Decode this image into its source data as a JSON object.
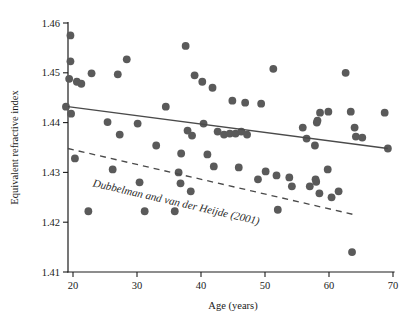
{
  "chart_data": {
    "type": "scatter",
    "title": "",
    "xlabel": "Age (years)",
    "ylabel": "Equivalent refractive index",
    "xlim": [
      18,
      70
    ],
    "ylim": [
      1.41,
      1.46
    ],
    "xticks": [
      20,
      30,
      40,
      50,
      60,
      70
    ],
    "yticks": [
      "1.41",
      "1.42",
      "1.43",
      "1.44",
      "1.45",
      "1.46"
    ],
    "grid": false,
    "legend": "none",
    "points": [
      {
        "x": 19.6,
        "y": 1.4575
      },
      {
        "x": 19.6,
        "y": 1.4523
      },
      {
        "x": 19.4,
        "y": 1.4488
      },
      {
        "x": 20.6,
        "y": 1.4482
      },
      {
        "x": 21.3,
        "y": 1.4478
      },
      {
        "x": 19.7,
        "y": 1.4418
      },
      {
        "x": 20.3,
        "y": 1.4328
      },
      {
        "x": 22.4,
        "y": 1.4222
      },
      {
        "x": 22.9,
        "y": 1.4499
      },
      {
        "x": 25.4,
        "y": 1.4401
      },
      {
        "x": 27.0,
        "y": 1.4497
      },
      {
        "x": 27.3,
        "y": 1.4376
      },
      {
        "x": 26.2,
        "y": 1.4306
      },
      {
        "x": 30.1,
        "y": 1.4398
      },
      {
        "x": 28.4,
        "y": 1.4527
      },
      {
        "x": 30.4,
        "y": 1.428
      },
      {
        "x": 31.2,
        "y": 1.4222
      },
      {
        "x": 34.5,
        "y": 1.4432
      },
      {
        "x": 36.5,
        "y": 1.43
      },
      {
        "x": 36.8,
        "y": 1.4278
      },
      {
        "x": 36.9,
        "y": 1.4338
      },
      {
        "x": 37.6,
        "y": 1.4554
      },
      {
        "x": 37.9,
        "y": 1.4384
      },
      {
        "x": 38.6,
        "y": 1.4374
      },
      {
        "x": 39.0,
        "y": 1.4495
      },
      {
        "x": 38.4,
        "y": 1.4262
      },
      {
        "x": 40.2,
        "y": 1.4482
      },
      {
        "x": 40.4,
        "y": 1.4398
      },
      {
        "x": 41.0,
        "y": 1.4336
      },
      {
        "x": 41.8,
        "y": 1.447
      },
      {
        "x": 42.6,
        "y": 1.4382
      },
      {
        "x": 42.0,
        "y": 1.4312
      },
      {
        "x": 43.6,
        "y": 1.4376
      },
      {
        "x": 44.5,
        "y": 1.4378
      },
      {
        "x": 44.9,
        "y": 1.4444
      },
      {
        "x": 45.4,
        "y": 1.4378
      },
      {
        "x": 45.9,
        "y": 1.431
      },
      {
        "x": 46.3,
        "y": 1.4382
      },
      {
        "x": 46.9,
        "y": 1.444
      },
      {
        "x": 47.2,
        "y": 1.4376
      },
      {
        "x": 48.9,
        "y": 1.4286
      },
      {
        "x": 49.4,
        "y": 1.4438
      },
      {
        "x": 50.1,
        "y": 1.4302
      },
      {
        "x": 51.8,
        "y": 1.4294
      },
      {
        "x": 52.0,
        "y": 1.4225
      },
      {
        "x": 51.3,
        "y": 1.4508
      },
      {
        "x": 53.8,
        "y": 1.429
      },
      {
        "x": 54.2,
        "y": 1.4272
      },
      {
        "x": 55.9,
        "y": 1.439
      },
      {
        "x": 56.5,
        "y": 1.4368
      },
      {
        "x": 57.0,
        "y": 1.4272
      },
      {
        "x": 57.8,
        "y": 1.4354
      },
      {
        "x": 57.9,
        "y": 1.4286
      },
      {
        "x": 58.0,
        "y": 1.4281
      },
      {
        "x": 58.1,
        "y": 1.44
      },
      {
        "x": 58.2,
        "y": 1.4404
      },
      {
        "x": 58.6,
        "y": 1.442
      },
      {
        "x": 58.5,
        "y": 1.4258
      },
      {
        "x": 59.8,
        "y": 1.4306
      },
      {
        "x": 59.9,
        "y": 1.4422
      },
      {
        "x": 60.4,
        "y": 1.425
      },
      {
        "x": 61.5,
        "y": 1.4262
      },
      {
        "x": 62.6,
        "y": 1.45
      },
      {
        "x": 63.4,
        "y": 1.4422
      },
      {
        "x": 63.6,
        "y": 1.414
      },
      {
        "x": 64.0,
        "y": 1.439
      },
      {
        "x": 64.2,
        "y": 1.4372
      },
      {
        "x": 65.2,
        "y": 1.437
      },
      {
        "x": 68.7,
        "y": 1.442
      },
      {
        "x": 69.2,
        "y": 1.4348
      },
      {
        "x": 18.9,
        "y": 1.4432
      },
      {
        "x": 33.0,
        "y": 1.4354
      },
      {
        "x": 35.9,
        "y": 1.4222
      }
    ],
    "fit_line": {
      "style": "solid",
      "label": "",
      "x1": 19.2,
      "y1": 1.4432,
      "x2": 69.2,
      "y2": 1.4348
    },
    "reference_line": {
      "style": "dashed",
      "label": "Dubbelman and van der Heijde (2001)",
      "x1": 19.2,
      "y1": 1.4348,
      "x2": 64.0,
      "y2": 1.4215
    }
  }
}
